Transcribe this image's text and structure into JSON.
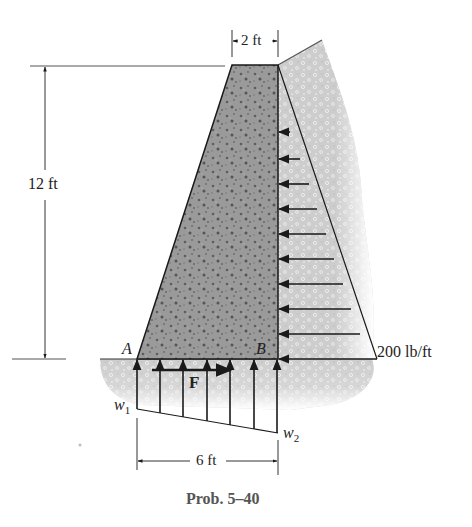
{
  "figure": {
    "caption": "Prob. 5–40",
    "colors": {
      "concrete": "#8f8f8f",
      "soil": "#d4d4d4",
      "line": "#1a1a1a",
      "text": "#222222"
    }
  },
  "dimensions": {
    "top_width": "2 ft",
    "height": "12 ft",
    "base_width": "6 ft"
  },
  "points": {
    "a": "A",
    "b": "B"
  },
  "loads": {
    "soil_pressure": "200 lb/ft",
    "friction_force": "F",
    "w1_base": "w",
    "w1_sub": "1",
    "w2_base": "w",
    "w2_sub": "2"
  }
}
